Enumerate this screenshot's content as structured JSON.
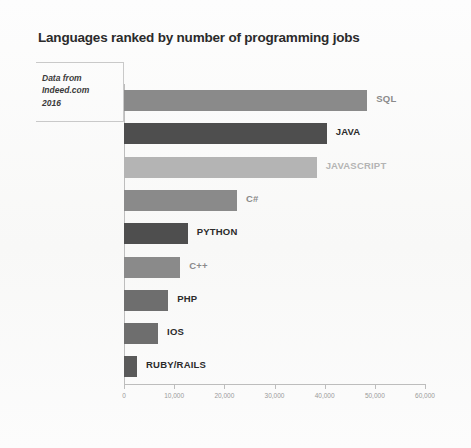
{
  "title": "Languages ranked by number of programming jobs",
  "source_note": {
    "line1": "Data from",
    "line2": "Indeed.com",
    "line3": "2016"
  },
  "colors": {
    "bar_medium": "#8a8a8a",
    "bar_dark": "#4e4e4e",
    "bar_light": "#b4b4b4",
    "label_dark": "#2b2b2b",
    "label_light": "#b4b4b4",
    "axis": "#bdbdbd",
    "tick_text": "#9a9a9a",
    "background": "#fbfbfa"
  },
  "chart_data": {
    "type": "bar",
    "orientation": "horizontal",
    "title": "Languages ranked by number of programming jobs",
    "xlabel": "",
    "ylabel": "",
    "xlim": [
      0,
      60000
    ],
    "grid": false,
    "legend": "none",
    "annotation": "Data from Indeed.com 2016",
    "xticks": [
      0,
      10000,
      20000,
      30000,
      40000,
      50000,
      60000
    ],
    "xtick_labels": [
      "0",
      "10,000",
      "20,000",
      "30,000",
      "40,000",
      "50,000",
      "60,000"
    ],
    "categories": [
      "SQL",
      "JAVA",
      "JAVASCRIPT",
      "C#",
      "PYTHON",
      "C++",
      "PHP",
      "IOS",
      "RUBY/RAILS"
    ],
    "values": [
      48500,
      40400,
      38400,
      22500,
      12700,
      11200,
      8800,
      6800,
      2600
    ],
    "bars": [
      {
        "label": "SQL",
        "value": 48500,
        "color": "#8a8a8a",
        "label_color": "#8a8a8a"
      },
      {
        "label": "JAVA",
        "value": 40400,
        "color": "#4e4e4e",
        "label_color": "#2b2b2b"
      },
      {
        "label": "JAVASCRIPT",
        "value": 38400,
        "color": "#b4b4b4",
        "label_color": "#b4b4b4"
      },
      {
        "label": "C#",
        "value": 22500,
        "color": "#8a8a8a",
        "label_color": "#8a8a8a"
      },
      {
        "label": "PYTHON",
        "value": 12700,
        "color": "#4e4e4e",
        "label_color": "#2b2b2b"
      },
      {
        "label": "C++",
        "value": 11200,
        "color": "#8a8a8a",
        "label_color": "#8a8a8a"
      },
      {
        "label": "PHP",
        "value": 8800,
        "color": "#6e6e6e",
        "label_color": "#2b2b2b"
      },
      {
        "label": "IOS",
        "value": 6800,
        "color": "#6e6e6e",
        "label_color": "#2b2b2b"
      },
      {
        "label": "RUBY/RAILS",
        "value": 2600,
        "color": "#5a5a5a",
        "label_color": "#2b2b2b"
      }
    ]
  }
}
